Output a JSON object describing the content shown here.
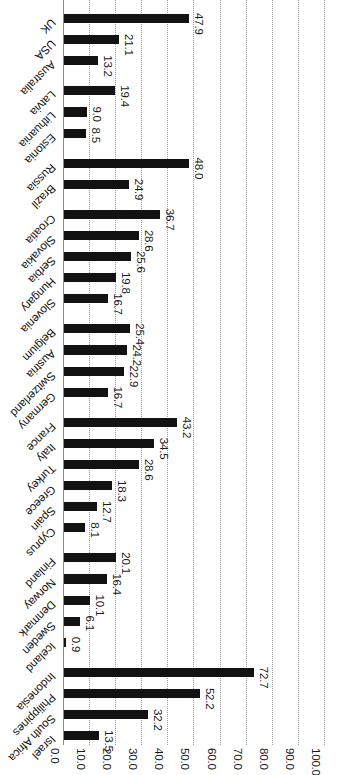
{
  "chart_data": {
    "type": "bar",
    "orientation": "vertical-rendered-rotated",
    "title": "",
    "subtitle": "",
    "xlabel": "",
    "ylabel": "",
    "ylim": [
      0.0,
      100.0
    ],
    "grid": true,
    "legend": null,
    "tick_labels": [
      "0.0",
      "10.0",
      "20.0",
      "30.0",
      "40.0",
      "50.0",
      "60.0",
      "70.0",
      "80.0",
      "90.0",
      "100.0"
    ],
    "tick_values": [
      0,
      10,
      20,
      30,
      40,
      50,
      60,
      70,
      80,
      90,
      100
    ],
    "bar_color": "#121212",
    "axis_color": "#8a8a8a",
    "grid_color": "#9a9a9a",
    "categories": [
      "UK",
      "USA",
      "Australia",
      "Latvia",
      "Lithuania",
      "Estonia",
      "Russia",
      "Brazil",
      "Croatia",
      "Slovakia",
      "Serbia",
      "Hungary",
      "Slovenia",
      "Belgium",
      "Austria",
      "Switzerland",
      "Germany",
      "France",
      "Italy",
      "Turkey",
      "Greece",
      "Spain",
      "Cyprus",
      "Finland",
      "Norway",
      "Denmark",
      "Sweden",
      "Iceland",
      "Indonesia",
      "Philippines",
      "South Africa",
      "Israel"
    ],
    "values": [
      47.9,
      21.1,
      13.2,
      19.4,
      9.0,
      8.5,
      48.0,
      24.9,
      36.7,
      28.6,
      25.6,
      19.8,
      16.7,
      25.4,
      24.2,
      22.9,
      16.7,
      43.2,
      34.5,
      28.6,
      18.3,
      12.7,
      8.1,
      20.1,
      16.4,
      10.1,
      6.1,
      0.9,
      72.7,
      52.2,
      32.2,
      13.5
    ],
    "value_labels": [
      "47.9",
      "21.1",
      "13.2",
      "19.4",
      "9.0",
      "8.5",
      "48.0",
      "24.9",
      "36.7",
      "28.6",
      "25.6",
      "19.8",
      "16.7",
      "25.4",
      "24.2",
      "22.9",
      "16.7",
      "43.2",
      "34.5",
      "28.6",
      "18.3",
      "12.7",
      "8.1",
      "20.1",
      "16.4",
      "10.1",
      "6.1",
      "0.9",
      "72.7",
      "52.2",
      "32.2",
      "13.5"
    ],
    "group_breaks_after": [
      2,
      5,
      7,
      12,
      16,
      22,
      27
    ]
  }
}
